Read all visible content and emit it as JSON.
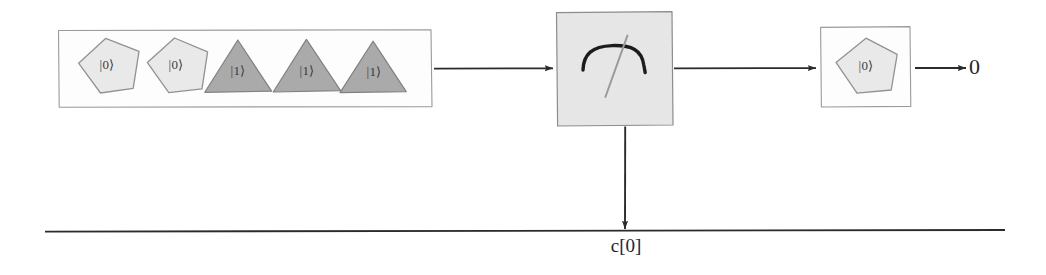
{
  "diagram": {
    "type": "quantum-circuit-sketch",
    "style": "hand-drawn",
    "background_color": "#ffffff",
    "ink_color": "#2b2b2b",
    "input_register": {
      "name": "input-register-box",
      "border_color": "#9a9a9a",
      "qubits": [
        {
          "shape": "pentagon",
          "label": "|0⟩",
          "fill": "#ebebeb",
          "stroke": "#8f8f8f"
        },
        {
          "shape": "pentagon",
          "label": "|0⟩",
          "fill": "#ebebeb",
          "stroke": "#8f8f8f"
        },
        {
          "shape": "triangle",
          "label": "|1⟩",
          "fill": "#a9a9a9",
          "stroke": "#7d7d7d"
        },
        {
          "shape": "triangle",
          "label": "|1⟩",
          "fill": "#a9a9a9",
          "stroke": "#7d7d7d"
        },
        {
          "shape": "triangle",
          "label": "|1⟩",
          "fill": "#a9a9a9",
          "stroke": "#7d7d7d"
        }
      ]
    },
    "gate": {
      "name": "measurement-gate",
      "symbol": "measurement-meter",
      "fill": "#e8e8e8",
      "stroke": "#8a8a8a"
    },
    "output_register": {
      "name": "output-register-box",
      "border_color": "#9a9a9a",
      "qubits": [
        {
          "shape": "pentagon",
          "label": "|0⟩",
          "fill": "#ebebeb",
          "stroke": "#8f8f8f"
        }
      ]
    },
    "classical_wire": {
      "name": "classical-register-wire",
      "label": "c[0]",
      "color": "#2b2b2b"
    },
    "result": {
      "name": "measurement-result",
      "label": "0"
    },
    "connectors": [
      {
        "name": "arrow-input-to-gate",
        "direction": "right"
      },
      {
        "name": "arrow-gate-to-output",
        "direction": "right"
      },
      {
        "name": "arrow-output-to-result",
        "direction": "right"
      },
      {
        "name": "arrow-gate-to-classical-wire",
        "direction": "down"
      }
    ]
  }
}
